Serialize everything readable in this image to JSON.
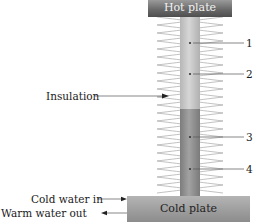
{
  "diagram": {
    "hot_plate_label": "Hot plate",
    "cold_plate_label": "Cold plate",
    "insulation_label": "Insulation",
    "cold_water_in_label": "Cold water in",
    "warm_water_out_label": "Warm water out",
    "points": [
      {
        "id": "1",
        "label": "1"
      },
      {
        "id": "2",
        "label": "2"
      },
      {
        "id": "3",
        "label": "3"
      },
      {
        "id": "4",
        "label": "4"
      }
    ],
    "colors": {
      "hot_plate": "#6a6a6a",
      "cold_plate": "#a0a0a0",
      "upper_rod": "#c8c8c8",
      "lower_rod": "#8e8e8e",
      "coil": "#9a9a9a",
      "leader_line": "#555555"
    }
  }
}
